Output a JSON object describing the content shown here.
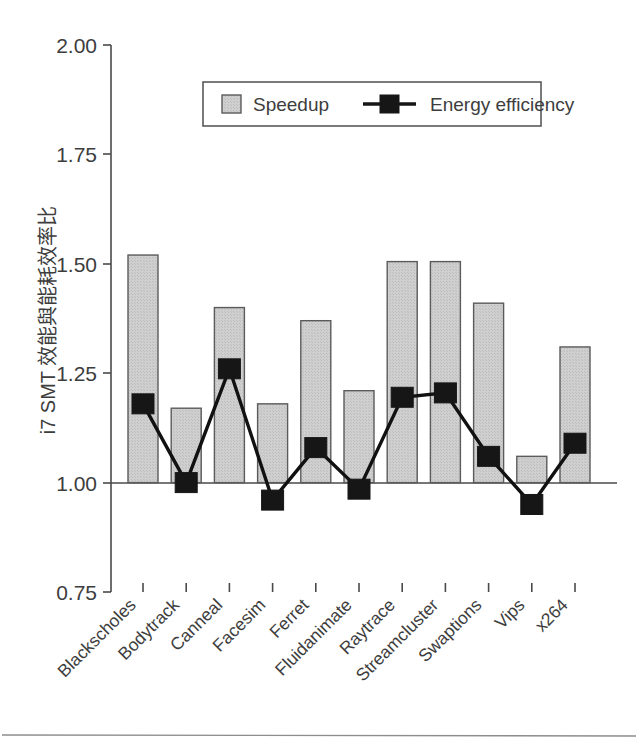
{
  "chart_data": {
    "type": "bar",
    "title": "",
    "subtitle": "",
    "xlabel": "",
    "ylabel": "i7 SMT 效能與能耗效率比",
    "ylim": [
      0.75,
      2.0
    ],
    "yticks": [
      "0.75",
      "1.00",
      "1.25",
      "1.50",
      "1.75",
      "2.00"
    ],
    "ytick_values": [
      0.75,
      1.0,
      1.25,
      1.5,
      1.75,
      2.0
    ],
    "grid": false,
    "baseline": 1.0,
    "legend_position": "top-center",
    "categories": [
      "Blackscholes",
      "Bodytrack",
      "Canneal",
      "Facesim",
      "Ferret",
      "Fluidanimate",
      "Raytrace",
      "Streamcluster",
      "Swaptions",
      "Vips",
      "x264"
    ],
    "series": [
      {
        "name": "Speedup",
        "render": "bar",
        "color": "#c9c9c9",
        "values": [
          1.52,
          1.17,
          1.4,
          1.18,
          1.37,
          1.21,
          1.505,
          1.505,
          1.41,
          1.06,
          1.31
        ]
      },
      {
        "name": "Energy efficiency",
        "render": "line-marker",
        "color": "#161616",
        "values": [
          1.18,
          1.0,
          1.26,
          0.96,
          1.08,
          0.985,
          1.195,
          1.205,
          1.06,
          0.95,
          1.09
        ]
      }
    ]
  },
  "legend": {
    "items": [
      {
        "label": "Speedup",
        "type": "bar-swatch"
      },
      {
        "label": "Energy efficiency",
        "type": "line-marker-swatch"
      }
    ]
  },
  "colors": {
    "bar_fill": "#c9c9c9",
    "bar_stroke": "#5b5b5b",
    "line": "#161616",
    "axis": "#4a4a4a",
    "text": "#3d3d3d",
    "background": "#ffffff"
  }
}
